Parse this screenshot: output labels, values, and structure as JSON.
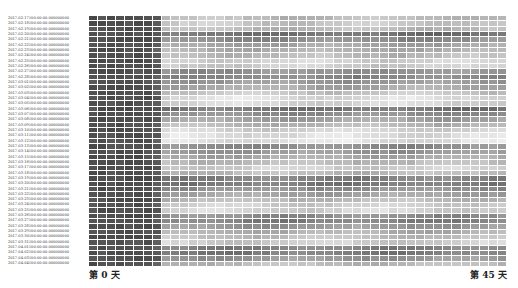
{
  "chart_data": {
    "type": "heatmap",
    "title": "",
    "xlabel": "",
    "ylabel": "",
    "x_tick_labels": {
      "first": "第 0 天",
      "last": "第 45 天"
    },
    "n_columns": 46,
    "colormap": "greys (dark = high)",
    "rows": [
      {
        "label": "2017-02-17T00:00:00.000000000",
        "level": 0.3
      },
      {
        "label": "2017-02-18T00:00:00.000000000",
        "level": 0.25
      },
      {
        "label": "2017-02-19T00:00:00.000000000",
        "level": 0.3
      },
      {
        "label": "2017-02-20T00:00:00.000000000",
        "level": 0.62
      },
      {
        "label": "2017-02-21T00:00:00.000000000",
        "level": 0.5
      },
      {
        "label": "2017-02-22T00:00:00.000000000",
        "level": 0.4
      },
      {
        "label": "2017-02-23T00:00:00.000000000",
        "level": 0.35
      },
      {
        "label": "2017-02-24T00:00:00.000000000",
        "level": 0.3
      },
      {
        "label": "2017-02-25T00:00:00.000000000",
        "level": 0.2
      },
      {
        "label": "2017-02-26T00:00:00.000000000",
        "level": 0.22
      },
      {
        "label": "2017-02-27T00:00:00.000000000",
        "level": 0.48
      },
      {
        "label": "2017-02-28T00:00:00.000000000",
        "level": 0.52
      },
      {
        "label": "2017-03-01T00:00:00.000000000",
        "level": 0.45
      },
      {
        "label": "2017-03-02T00:00:00.000000000",
        "level": 0.38
      },
      {
        "label": "2017-03-03T00:00:00.000000000",
        "level": 0.25
      },
      {
        "label": "2017-03-04T00:00:00.000000000",
        "level": 0.15
      },
      {
        "label": "2017-03-05T00:00:00.000000000",
        "level": 0.18
      },
      {
        "label": "2017-03-06T00:00:00.000000000",
        "level": 0.6
      },
      {
        "label": "2017-03-07T00:00:00.000000000",
        "level": 0.5
      },
      {
        "label": "2017-03-08T00:00:00.000000000",
        "level": 0.4
      },
      {
        "label": "2017-03-09T00:00:00.000000000",
        "level": 0.32
      },
      {
        "label": "2017-03-10T00:00:00.000000000",
        "level": 0.2
      },
      {
        "label": "2017-03-11T00:00:00.000000000",
        "level": 0.15
      },
      {
        "label": "2017-03-12T00:00:00.000000000",
        "level": 0.14
      },
      {
        "label": "2017-03-13T00:00:00.000000000",
        "level": 0.5
      },
      {
        "label": "2017-03-14T00:00:00.000000000",
        "level": 0.45
      },
      {
        "label": "2017-03-15T00:00:00.000000000",
        "level": 0.38
      },
      {
        "label": "2017-03-16T00:00:00.000000000",
        "level": 0.3
      },
      {
        "label": "2017-03-17T00:00:00.000000000",
        "level": 0.22
      },
      {
        "label": "2017-03-18T00:00:00.000000000",
        "level": 0.3
      },
      {
        "label": "2017-03-19T00:00:00.000000000",
        "level": 0.55
      },
      {
        "label": "2017-03-20T00:00:00.000000000",
        "level": 0.58
      },
      {
        "label": "2017-03-21T00:00:00.000000000",
        "level": 0.48
      },
      {
        "label": "2017-03-22T00:00:00.000000000",
        "level": 0.4
      },
      {
        "label": "2017-03-23T00:00:00.000000000",
        "level": 0.3
      },
      {
        "label": "2017-03-24T00:00:00.000000000",
        "level": 0.22
      },
      {
        "label": "2017-03-25T00:00:00.000000000",
        "level": 0.2
      },
      {
        "label": "2017-03-26T00:00:00.000000000",
        "level": 0.5
      },
      {
        "label": "2017-03-27T00:00:00.000000000",
        "level": 0.55
      },
      {
        "label": "2017-03-28T00:00:00.000000000",
        "level": 0.45
      },
      {
        "label": "2017-03-29T00:00:00.000000000",
        "level": 0.35
      },
      {
        "label": "2017-03-30T00:00:00.000000000",
        "level": 0.28
      },
      {
        "label": "2017-03-31T00:00:00.000000000",
        "level": 0.22
      },
      {
        "label": "2017-04-01T00:00:00.000000000",
        "level": 0.55
      },
      {
        "label": "2017-04-02T00:00:00.000000000",
        "level": 0.58
      },
      {
        "label": "2017-04-03T00:00:00.000000000",
        "level": 0.45
      },
      {
        "label": "2017-04-04T00:00:00.000000000",
        "level": 0.3
      }
    ],
    "early_columns_dark": 8,
    "early_level": 0.82
  }
}
